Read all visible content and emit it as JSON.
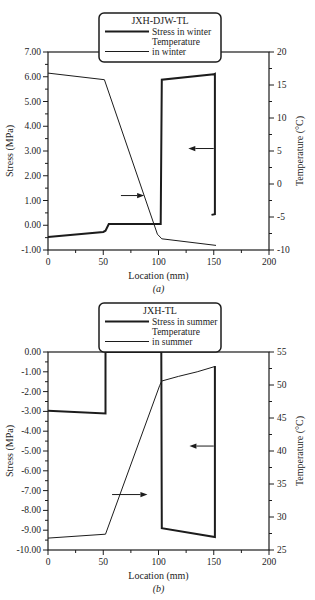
{
  "background": "#ffffff",
  "ink": "#1c1c1c",
  "chart_data": [
    {
      "type": "line",
      "title": "JXH-DJW-TL",
      "xlabel": "Location (mm)",
      "caption": "(a)",
      "x_axis": {
        "min": 0,
        "max": 200,
        "major": 50,
        "minor": 25,
        "decimals": 0
      },
      "left_axis": {
        "label": "Stress (MPa)",
        "min": -1,
        "max": 7,
        "major": 1,
        "minor": 0.5,
        "decimals": 2
      },
      "right_axis": {
        "label": "Temperature (°C)",
        "min": -10,
        "max": 20,
        "major": 5,
        "minor": 2.5,
        "decimals": 0
      },
      "legend": {
        "title": "JXH-DJW-TL",
        "rows": [
          {
            "sample": "thick",
            "label": "Stress in winter"
          },
          {
            "sample": "none",
            "label": "Temperature"
          },
          {
            "sample": "thin",
            "label": "in winter"
          }
        ]
      },
      "series": [
        {
          "name": "Stress in winter",
          "axis": "left",
          "style": "thick",
          "points": [
            [
              0,
              -0.47
            ],
            [
              50,
              -0.27
            ],
            [
              52,
              -0.22
            ],
            [
              55,
              0.05
            ],
            [
              102,
              0.05
            ],
            [
              103,
              5.88
            ],
            [
              150,
              6.1
            ],
            [
              151,
              6.12
            ],
            [
              151,
              0.45
            ],
            [
              148,
              0.42
            ]
          ]
        },
        {
          "name": "Temperature in winter",
          "axis": "right",
          "style": "thin",
          "points": [
            [
              0,
              16.8
            ],
            [
              51,
              15.8
            ],
            [
              99,
              -7.6
            ],
            [
              103,
              -8.3
            ],
            [
              152,
              -9.3
            ]
          ]
        }
      ],
      "arrows": [
        {
          "from": [
            66,
            1.2
          ],
          "to": [
            87,
            1.2
          ],
          "axis": "left",
          "points_to": "right-axis"
        },
        {
          "from": [
            150,
            3.1
          ],
          "to": [
            127,
            3.1
          ],
          "axis": "left",
          "points_to": "left-axis"
        }
      ]
    },
    {
      "type": "line",
      "title": "JXH-TL",
      "xlabel": "Location (mm)",
      "caption": "(b)",
      "x_axis": {
        "min": 0,
        "max": 200,
        "major": 50,
        "minor": 25,
        "decimals": 0
      },
      "left_axis": {
        "label": "Stress (MPa)",
        "min": -10,
        "max": 0,
        "major": 1,
        "minor": 0.5,
        "decimals": 2
      },
      "right_axis": {
        "label": "Temperature (°C)",
        "min": 25,
        "max": 55,
        "major": 5,
        "minor": 2.5,
        "decimals": 0
      },
      "legend": {
        "title": "JXH-TL",
        "rows": [
          {
            "sample": "thick",
            "label": "Stress in summer"
          },
          {
            "sample": "none",
            "label": "Temperature"
          },
          {
            "sample": "thin",
            "label": "in summer"
          }
        ]
      },
      "series": [
        {
          "name": "Stress in summer",
          "axis": "left",
          "style": "thick",
          "points": [
            [
              0,
              -2.97
            ],
            [
              52,
              -3.1
            ],
            [
              52,
              0
            ],
            [
              102.5,
              0
            ],
            [
              103,
              -8.9
            ],
            [
              151,
              -9.35
            ],
            [
              151,
              -0.7
            ]
          ]
        },
        {
          "name": "Temperature in summer",
          "axis": "right",
          "style": "thin",
          "points": [
            [
              0,
              26.8
            ],
            [
              52,
              27.4
            ],
            [
              101,
              49.9
            ],
            [
              103,
              50.6
            ],
            [
              118,
              51.3
            ],
            [
              135,
              52
            ],
            [
              151,
              52.8
            ]
          ]
        }
      ],
      "arrows": [
        {
          "from": [
            58,
            -7.2
          ],
          "to": [
            90,
            -7.2
          ],
          "axis": "left",
          "points_to": "right-axis"
        },
        {
          "from": [
            150,
            -4.75
          ],
          "to": [
            128,
            -4.75
          ],
          "axis": "left",
          "points_to": "left-axis"
        }
      ]
    }
  ]
}
